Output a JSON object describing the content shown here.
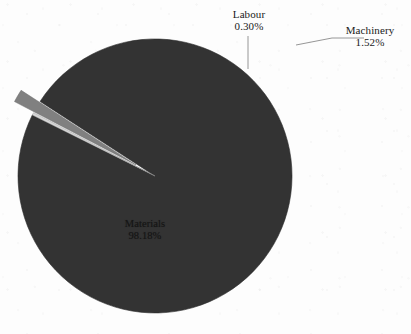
{
  "chart_data": {
    "type": "pie",
    "title": "",
    "subtitle": "",
    "xlabel": "",
    "ylabel": "",
    "legend_position": "none",
    "grid": false,
    "labels_show_percent": true,
    "categories": [
      "Materials",
      "Labour",
      "Machinery"
    ],
    "values": [
      98.18,
      0.3,
      1.52
    ],
    "value_unit": "%",
    "slices": [
      {
        "name": "Materials",
        "label": "Materials",
        "percent": 98.18,
        "percent_text": "98.18%",
        "color": "#333333",
        "exploded": false
      },
      {
        "name": "Labour",
        "label": "Labour",
        "percent": 0.3,
        "percent_text": "0.30%",
        "color": "#d8d8d8",
        "exploded": false
      },
      {
        "name": "Machinery",
        "label": "Machinery",
        "percent": 1.52,
        "percent_text": "1.52%",
        "color": "#808080",
        "exploded": true
      }
    ]
  },
  "figure": {
    "background_color": "#fdfdfd",
    "outline_color": "#2b2b2b",
    "leader_line_color": "#8a8a8a"
  }
}
